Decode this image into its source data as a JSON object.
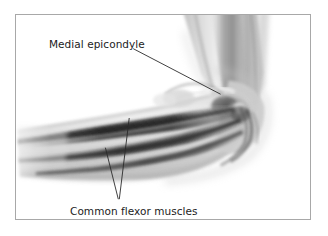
{
  "figure": {
    "kind": "anatomical-illustration",
    "background_color": "#ffffff",
    "border_color": "#a8a8a8"
  },
  "labels": {
    "epicondyle": {
      "text": "Medial epicondyle",
      "leader": "single straight line running down-right from the end of the text to the bony bump at the inner elbow"
    },
    "flexor": {
      "text": "Common flexor muscles",
      "leader": "two straight lines converging downward from the forearm muscle bellies to the text"
    }
  },
  "illustration": {
    "style": "grayscale shaded medical drawing",
    "tones": {
      "skin_light": "#e9e9e9",
      "skin_mid": "#cfcfcf",
      "skin_shadow": "#a9a9a9",
      "muscle_mid": "#8f8f8f",
      "muscle_dark": "#555555",
      "muscle_darkest": "#2f2f2f",
      "line_color": "#2a2a2a"
    },
    "parts": [
      {
        "name": "upper-arm",
        "description": "humerus shaft descending from top edge toward the elbow"
      },
      {
        "name": "elbow-joint",
        "description": "flexed joint at right with dark condylar shading"
      },
      {
        "name": "medial-epicondyle",
        "description": "bony prominence on the inner elbow"
      },
      {
        "name": "common-flexor-muscles",
        "description": "dark banded muscle bellies sweeping left along the forearm"
      },
      {
        "name": "forearm",
        "description": "tapering forearm extending to the left edge"
      }
    ]
  }
}
